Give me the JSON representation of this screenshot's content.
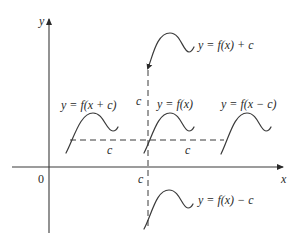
{
  "axes": {
    "x_label": "x",
    "y_label": "y",
    "origin_label": "0"
  },
  "shift_labels": {
    "vertical_up": "c",
    "vertical_down": "c",
    "horizontal_left": "c",
    "horizontal_right": "c"
  },
  "curves": [
    {
      "id": "f-x-plus-c",
      "label": "y = f(x + c)",
      "shift": "left by c"
    },
    {
      "id": "f-x",
      "label": "y = f(x)",
      "shift": "none"
    },
    {
      "id": "f-x-minus-c",
      "label": "y = f(x − c)",
      "shift": "right by c"
    },
    {
      "id": "f-x-up",
      "label": "y = f(x) + c",
      "shift": "up by c"
    },
    {
      "id": "f-x-down",
      "label": "y = f(x) − c",
      "shift": "down by c"
    }
  ],
  "colors": {
    "line": "#3a3a3a",
    "text": "#2a2a2a",
    "background": "#ffffff"
  }
}
